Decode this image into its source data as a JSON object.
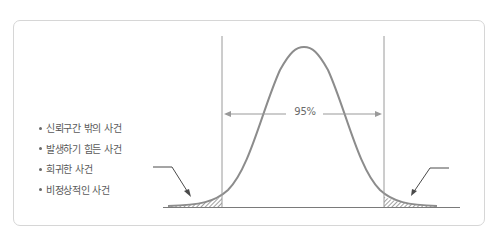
{
  "figure": {
    "type": "normal-distribution-confidence-interval",
    "interval_label": "95%",
    "bullets": [
      "신뢰구간 밖의 사건",
      "발생하기 힘든 사건",
      "희귀한 사건",
      "비정상적인 사건"
    ],
    "colors": {
      "frame": "#d6d6d6",
      "curve": "#8c8c8c",
      "lines": "#9a9a9a",
      "text": "#5a5a5a",
      "hatch": "#6e6e6e"
    }
  }
}
